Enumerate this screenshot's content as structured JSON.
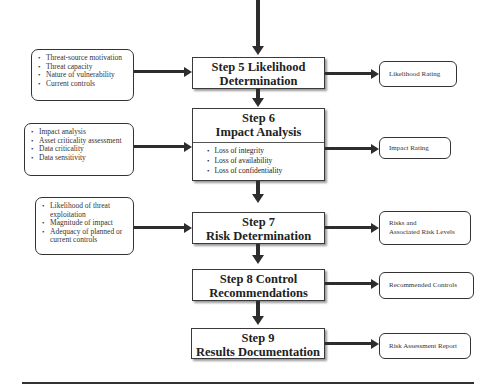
{
  "diagram": {
    "steps": [
      {
        "id": "step5",
        "line1": "Step 5 Likelihood",
        "line2": "Determination"
      },
      {
        "id": "step6",
        "line1": "Step 6",
        "line2": "Impact Analysis",
        "items": [
          "Loss of integrity",
          "Loss of availability",
          "Loss of confidentiality"
        ]
      },
      {
        "id": "step7",
        "line1": "Step 7",
        "line2": "Risk Determination"
      },
      {
        "id": "step8",
        "line1": "Step 8 Control",
        "line2": "Recommendations"
      },
      {
        "id": "step9",
        "line1": "Step 9",
        "line2": "Results Documentation"
      }
    ],
    "inputs": [
      {
        "items": [
          "Threat-source motivation",
          "Threat capacity",
          "Nature of vulnerability",
          "Current controls"
        ]
      },
      {
        "items": [
          "Impact analysis",
          "Asset criticality assessment",
          "Data criticality",
          "Data sensitivity"
        ]
      },
      {
        "items": [
          "Likelihood of threat exploitation",
          "Magnitude of impact",
          "Adequacy of planned or current controls"
        ]
      }
    ],
    "outputs": [
      {
        "line1": "Likelihood Rating",
        "line2": ""
      },
      {
        "line1": "Impact Rating",
        "line2": ""
      },
      {
        "line1": "Risks and",
        "line2": "Associated Risk Levels"
      },
      {
        "line1": "Recommended Controls",
        "line2": ""
      },
      {
        "line1": "Risk Assessment Report",
        "line2": ""
      }
    ]
  }
}
